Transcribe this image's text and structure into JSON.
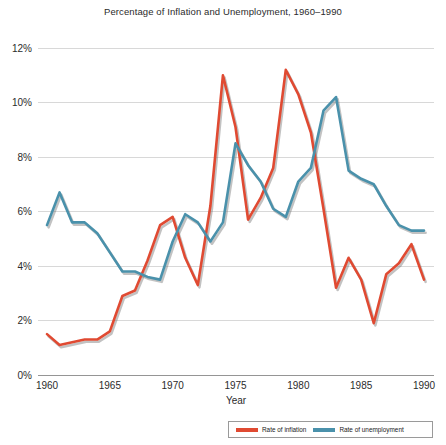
{
  "chart_data": {
    "type": "line",
    "title": "Percentage of Inflation and Unemployment, 1960–1990",
    "xlabel": "Year",
    "ylabel": "",
    "xlim": [
      1960,
      1990
    ],
    "ylim": [
      0,
      12
    ],
    "grid": true,
    "legend_position": "bottom-right",
    "x": [
      1960,
      1961,
      1962,
      1963,
      1964,
      1965,
      1966,
      1967,
      1968,
      1969,
      1970,
      1971,
      1972,
      1973,
      1974,
      1975,
      1976,
      1977,
      1978,
      1979,
      1980,
      1981,
      1982,
      1983,
      1984,
      1985,
      1986,
      1987,
      1988,
      1989,
      1990
    ],
    "xticks": [
      "1960",
      "1965",
      "1970",
      "1975",
      "1980",
      "1985",
      "1990"
    ],
    "yticks": [
      "0%",
      "2%",
      "4%",
      "6%",
      "8%",
      "10%",
      "12%"
    ],
    "series": [
      {
        "name": "Rate of inflation",
        "color": "#e04a32",
        "values": [
          1.5,
          1.1,
          1.2,
          1.3,
          1.3,
          1.6,
          2.9,
          3.1,
          4.2,
          5.5,
          5.8,
          4.3,
          3.3,
          6.2,
          11.0,
          9.1,
          5.7,
          6.5,
          7.6,
          11.2,
          10.3,
          8.9,
          6.1,
          3.2,
          4.3,
          3.5,
          1.9,
          3.7,
          4.1,
          4.8,
          3.5
        ]
      },
      {
        "name": "Rate of unemployment",
        "color": "#4a91ab",
        "values": [
          5.5,
          6.7,
          5.6,
          5.6,
          5.2,
          4.5,
          3.8,
          3.8,
          3.6,
          3.5,
          4.9,
          5.9,
          5.6,
          4.9,
          5.6,
          8.5,
          7.7,
          7.1,
          6.1,
          5.8,
          7.1,
          7.6,
          9.7,
          10.2,
          7.5,
          7.2,
          7.0,
          6.2,
          5.5,
          5.3,
          5.3
        ]
      }
    ]
  },
  "legend": {
    "items": [
      {
        "label": "Rate of inflation",
        "color": "#e04a32"
      },
      {
        "label": "Rate of unemployment",
        "color": "#4a91ab"
      }
    ]
  }
}
